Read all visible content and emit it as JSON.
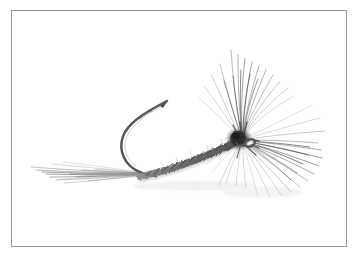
{
  "image": {
    "subject": "artificial fishing fly",
    "subject_detail": "hand-tied dry fly with hackle on a barbed hook",
    "medium": "grayscale photograph",
    "background_color": "#ffffff",
    "border_color": "#9c9c9c",
    "ink_color": "#4a4a4a",
    "width": 359,
    "height": 258
  },
  "frame": {
    "x": 11,
    "y": 10,
    "width": 336,
    "height": 237,
    "border_width": 1
  },
  "chart_data": {
    "type": "scatter",
    "title": "",
    "xlabel": "",
    "ylabel": "",
    "x": [],
    "values": []
  },
  "fly": {
    "parts": [
      {
        "name": "hook-bend",
        "label": "Hook bend and point"
      },
      {
        "name": "hook-shank",
        "label": "Hook shank"
      },
      {
        "name": "hook-eye",
        "label": "Hook eye"
      },
      {
        "name": "tail-fibers",
        "label": "Tail fibers"
      },
      {
        "name": "dubbed-body",
        "label": "Dubbed body"
      },
      {
        "name": "hackle-collar",
        "label": "Hackle collar"
      },
      {
        "name": "thread-head",
        "label": "Thread head"
      }
    ],
    "hook": {
      "point_tip": [
        167,
        101
      ],
      "barb": [
        152,
        112
      ],
      "bend_left": [
        121,
        139
      ],
      "bend_bottom": [
        133,
        169
      ],
      "shank_end": [
        249,
        143
      ],
      "eye": [
        250,
        143
      ],
      "eye_radius": 4.0,
      "wire_color": "#5d5d5d",
      "wire_width": 2.6
    },
    "body": {
      "start": [
        135,
        171
      ],
      "end": [
        241,
        139
      ],
      "max_thickness": 13,
      "min_thickness": 5,
      "color": "#6a6a6a",
      "fiber_count": 150
    },
    "tail": {
      "origin": [
        140,
        172
      ],
      "tip_x_min": 29,
      "tip_x_max": 118,
      "tip_y_min": 166,
      "tip_y_max": 180,
      "strand_count": 16,
      "color": "#7b7b7b"
    },
    "hackle": {
      "origin": [
        243,
        139
      ],
      "fiber_count": 120,
      "length_min": 36,
      "length_max": 105,
      "angle_start_deg": -122,
      "angle_end_deg": 68,
      "color": "#5a5a5a",
      "reach_up": [
        245,
        42
      ],
      "reach_right": [
        343,
        200
      ]
    },
    "head": {
      "center": [
        240,
        139
      ],
      "radius_x": 13,
      "radius_y": 11,
      "color": "#2f2f2f"
    }
  }
}
